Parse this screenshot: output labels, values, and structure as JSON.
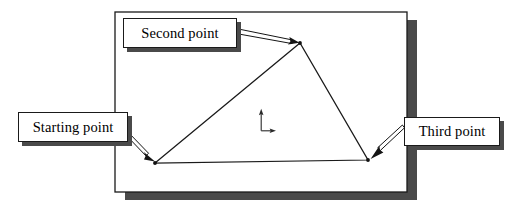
{
  "figure": {
    "background_color": "#ffffff",
    "canvas": {
      "width": 517,
      "height": 214
    }
  },
  "drawing_area": {
    "name": "drawing-frame",
    "border_color": "#1a1a1a",
    "fill_color": "#ffffff",
    "shadow_color": "#4a4a4a",
    "bounds": {
      "x": 115,
      "y": 12,
      "width": 292,
      "height": 180
    },
    "shadow_offset": {
      "x": 10,
      "y": 8
    }
  },
  "shape": {
    "name": "triangle",
    "stroke_color": "#1a1a1a",
    "fill_color": "none",
    "vertices": [
      {
        "id": "starting",
        "x": 155,
        "y": 163
      },
      {
        "id": "second",
        "x": 300,
        "y": 43
      },
      {
        "id": "third",
        "x": 368,
        "y": 160
      }
    ]
  },
  "axis_marker": {
    "name": "axis-indicator",
    "color": "#2a2a2a",
    "origin": {
      "x": 261,
      "y": 131
    },
    "y_axis_tip": {
      "x": 261,
      "y": 109
    },
    "x_axis_tip": {
      "x": 276,
      "y": 131
    }
  },
  "callouts": [
    {
      "id": "second",
      "label": "Second point",
      "box": {
        "x": 123,
        "y": 18,
        "width": 114,
        "height": 30
      },
      "leader_from": {
        "x": 237,
        "y": 31
      },
      "leader_to": {
        "x": 299,
        "y": 43
      }
    },
    {
      "id": "starting",
      "label": "Starting point",
      "box": {
        "x": 18,
        "y": 112,
        "width": 110,
        "height": 30
      },
      "leader_from": {
        "x": 128,
        "y": 133
      },
      "leader_to": {
        "x": 155,
        "y": 161
      }
    },
    {
      "id": "third",
      "label": "Third point",
      "box": {
        "x": 404,
        "y": 117,
        "width": 96,
        "height": 29
      },
      "leader_from": {
        "x": 403,
        "y": 130
      },
      "leader_to": {
        "x": 371,
        "y": 159
      }
    }
  ]
}
